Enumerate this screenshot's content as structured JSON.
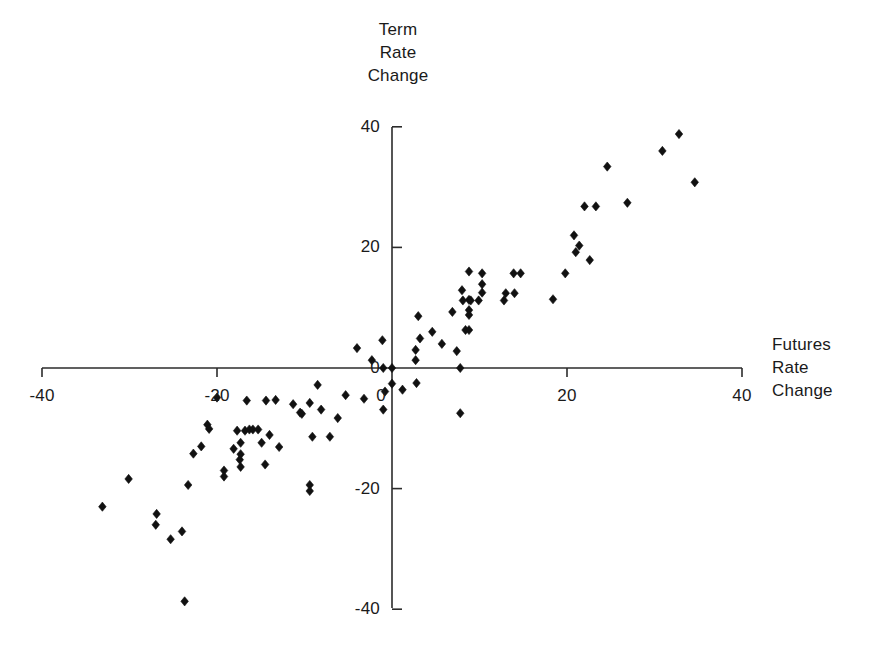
{
  "chart_data": {
    "type": "scatter",
    "title": "",
    "xlabel": "Futures Rate Change",
    "ylabel": "Term Rate Change",
    "xlim": [
      -40,
      40
    ],
    "ylim": [
      -40,
      40
    ],
    "xticks": [
      -40,
      -20,
      0,
      20,
      40
    ],
    "xtick_labels": [
      "-40",
      "-20",
      "0",
      "20",
      "40"
    ],
    "yticks": [
      -40,
      -20,
      0,
      20,
      40
    ],
    "ytick_labels": [
      "-40",
      "-20",
      "0",
      "20",
      "40"
    ],
    "grid": false,
    "legend": false,
    "marker": "diamond",
    "marker_color": "#111111",
    "axes_style": "crossed-at-origin",
    "n_points": 96,
    "points": [
      [
        -33.1,
        -23.0
      ],
      [
        -30.1,
        -18.4
      ],
      [
        -27.0,
        -26.0
      ],
      [
        -26.9,
        -24.2
      ],
      [
        -25.3,
        -28.4
      ],
      [
        -24.0,
        -27.1
      ],
      [
        -23.7,
        -38.7
      ],
      [
        -23.3,
        -19.4
      ],
      [
        -22.7,
        -14.2
      ],
      [
        -21.8,
        -13.0
      ],
      [
        -21.1,
        -9.4
      ],
      [
        -20.9,
        -10.1
      ],
      [
        -20.0,
        -4.9
      ],
      [
        -19.2,
        -17.0
      ],
      [
        -19.2,
        -18.0
      ],
      [
        -18.1,
        -13.4
      ],
      [
        -17.7,
        -10.4
      ],
      [
        -17.4,
        -15.2
      ],
      [
        -17.3,
        -12.4
      ],
      [
        -17.3,
        -14.3
      ],
      [
        -17.3,
        -16.4
      ],
      [
        -16.8,
        -10.4
      ],
      [
        -16.6,
        -5.4
      ],
      [
        -16.3,
        -10.2
      ],
      [
        -15.9,
        -10.2
      ],
      [
        -15.3,
        -10.2
      ],
      [
        -14.9,
        -12.4
      ],
      [
        -14.5,
        -16.0
      ],
      [
        -14.4,
        -5.4
      ],
      [
        -14.0,
        -11.1
      ],
      [
        -13.3,
        -5.3
      ],
      [
        -12.9,
        -13.1
      ],
      [
        -11.3,
        -6.0
      ],
      [
        -10.5,
        -7.4
      ],
      [
        -10.3,
        -7.6
      ],
      [
        -9.4,
        -5.8
      ],
      [
        -9.4,
        -19.4
      ],
      [
        -9.4,
        -20.4
      ],
      [
        -9.1,
        -11.4
      ],
      [
        -8.5,
        -2.8
      ],
      [
        -8.1,
        -6.9
      ],
      [
        -7.1,
        -11.4
      ],
      [
        -6.2,
        -8.3
      ],
      [
        -5.3,
        -4.5
      ],
      [
        -4.0,
        3.3
      ],
      [
        -3.2,
        -5.1
      ],
      [
        -2.3,
        1.3
      ],
      [
        -1.1,
        4.6
      ],
      [
        -1.0,
        0.0
      ],
      [
        -1.0,
        -6.9
      ],
      [
        -0.8,
        -3.9
      ],
      [
        0.0,
        0.0
      ],
      [
        0.0,
        -2.6
      ],
      [
        1.2,
        -3.6
      ],
      [
        2.7,
        3.0
      ],
      [
        2.7,
        1.3
      ],
      [
        2.8,
        -2.5
      ],
      [
        3.0,
        8.6
      ],
      [
        3.2,
        4.9
      ],
      [
        4.6,
        6.0
      ],
      [
        5.7,
        4.0
      ],
      [
        6.9,
        9.3
      ],
      [
        7.4,
        2.8
      ],
      [
        7.8,
        0.0
      ],
      [
        7.8,
        -7.5
      ],
      [
        8.0,
        12.9
      ],
      [
        8.1,
        11.2
      ],
      [
        8.4,
        6.3
      ],
      [
        8.8,
        11.3
      ],
      [
        8.8,
        9.6
      ],
      [
        8.8,
        8.8
      ],
      [
        8.8,
        6.3
      ],
      [
        8.8,
        16.0
      ],
      [
        9.0,
        11.2
      ],
      [
        9.9,
        11.2
      ],
      [
        10.3,
        15.7
      ],
      [
        10.3,
        13.9
      ],
      [
        10.3,
        12.5
      ],
      [
        12.8,
        11.2
      ],
      [
        13.0,
        12.4
      ],
      [
        13.9,
        15.7
      ],
      [
        14.0,
        12.4
      ],
      [
        14.7,
        15.7
      ],
      [
        18.4,
        11.4
      ],
      [
        19.8,
        15.7
      ],
      [
        20.8,
        22.0
      ],
      [
        21.0,
        19.2
      ],
      [
        21.4,
        20.3
      ],
      [
        22.0,
        26.8
      ],
      [
        22.6,
        17.9
      ],
      [
        23.3,
        26.8
      ],
      [
        24.6,
        33.4
      ],
      [
        26.9,
        27.4
      ],
      [
        30.9,
        36.0
      ],
      [
        32.8,
        38.8
      ],
      [
        34.6,
        30.8
      ]
    ]
  },
  "axis_titles": {
    "y": "Term\nRate\nChange",
    "x": "Futures\nRate\nChange"
  },
  "colors": {
    "marker": "#111111",
    "axis": "#2b2b2b",
    "background": "#ffffff",
    "text": "#1a1a1a"
  }
}
